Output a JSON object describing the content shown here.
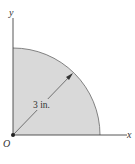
{
  "figure": {
    "axes": {
      "x_label": "x",
      "y_label": "y",
      "origin_label": "O"
    },
    "shape": {
      "type": "quarter-circle",
      "radius_label": "3 in.",
      "fill_color": "#d9d9d9",
      "stroke_color": "#555555"
    },
    "colors": {
      "axis": "#444444",
      "text": "#333333"
    }
  }
}
